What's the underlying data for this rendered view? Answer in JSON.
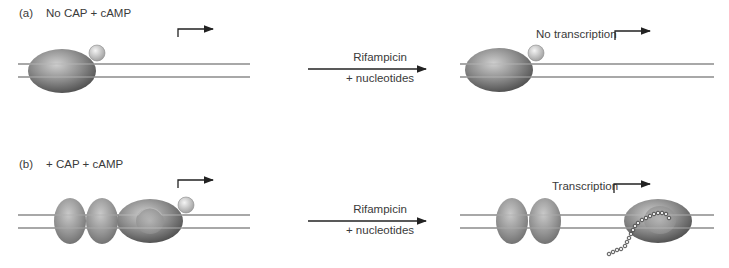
{
  "panels": [
    {
      "id": "a",
      "letter": "(a)",
      "condition": "No CAP + cAMP",
      "reaction_top": "Rifampicin",
      "reaction_bottom": "+ nucleotides",
      "result": "No transcription"
    },
    {
      "id": "b",
      "letter": "(b)",
      "condition": "+ CAP + cAMP",
      "reaction_top": "Rifampicin",
      "reaction_bottom": "+ nucleotides",
      "result": "Transcription"
    }
  ],
  "colors": {
    "dna": "#a8a8a8",
    "polymerase_dark": "#5a5a5a",
    "polymerase_light": "#c8c8c8",
    "cap_dimer": "#8e8e8e",
    "sigma": "#d8d8d8",
    "arrow": "#222222"
  }
}
